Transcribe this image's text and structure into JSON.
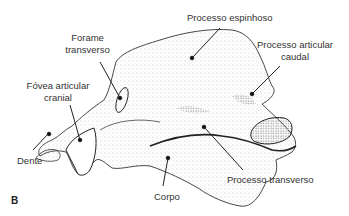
{
  "figure": {
    "panel_letter": "B",
    "labels": {
      "processo_espinhoso": "Processo espinhoso",
      "forame_transverso_1": "Forame",
      "forame_transverso_2": "transverso",
      "processo_articular_caudal_1": "Processo articular",
      "processo_articular_caudal_2": "caudal",
      "fovea_articular_cranial_1": "Fóvea articular",
      "fovea_articular_cranial_2": "cranial",
      "dente": "Dente",
      "corpo": "Corpo",
      "processo_transverso": "Processo transverso"
    },
    "colors": {
      "ink": "#222222",
      "text": "#333333",
      "stipple": "#9a9a9a",
      "background": "#ffffff"
    }
  }
}
